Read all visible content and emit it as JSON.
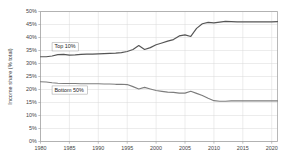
{
  "chart_data": {
    "type": "line",
    "title": "",
    "xlabel": "",
    "ylabel": "Income share (% total)",
    "xlim": [
      1980,
      2021
    ],
    "ylim": [
      0,
      50
    ],
    "grid": true,
    "legend_position": "inline-labels",
    "x_ticks": [
      "1980",
      "1985",
      "1990",
      "1995",
      "2000",
      "2005",
      "2010",
      "2015",
      "2020"
    ],
    "x_tick_values": [
      1980,
      1985,
      1990,
      1995,
      2000,
      2005,
      2010,
      2015,
      2020
    ],
    "y_ticks": [
      "0%",
      "5%",
      "10%",
      "15%",
      "20%",
      "25%",
      "30%",
      "35%",
      "40%",
      "45%",
      "50%"
    ],
    "y_tick_values": [
      0,
      5,
      10,
      15,
      20,
      25,
      30,
      35,
      40,
      45,
      50
    ],
    "x": [
      1980,
      1981,
      1982,
      1983,
      1984,
      1985,
      1986,
      1987,
      1988,
      1989,
      1990,
      1991,
      1992,
      1993,
      1994,
      1995,
      1996,
      1997,
      1998,
      1999,
      2000,
      2001,
      2002,
      2003,
      2004,
      2005,
      2006,
      2007,
      2008,
      2009,
      2010,
      2011,
      2012,
      2013,
      2014,
      2015,
      2016,
      2017,
      2018,
      2019,
      2020,
      2021
    ],
    "series": [
      {
        "name": "Top 10%",
        "color": "#555555",
        "label_x": 1982.0,
        "label_y": 36.4,
        "values": [
          32.6,
          32.6,
          32.9,
          33.4,
          33.5,
          33.2,
          33.3,
          33.5,
          33.6,
          33.6,
          33.7,
          33.8,
          33.9,
          34.0,
          34.2,
          34.6,
          35.4,
          36.9,
          35.4,
          36.1,
          37.2,
          37.9,
          38.6,
          39.2,
          40.6,
          41.0,
          40.4,
          43.5,
          45.3,
          45.8,
          45.6,
          45.9,
          46.2,
          46.1,
          46.0,
          46.0,
          46.0,
          46.0,
          46.0,
          46.0,
          46.0,
          46.1
        ]
      },
      {
        "name": "Bottom 50%",
        "color": "#7d7d7d",
        "label_x": 1982.0,
        "label_y": 19.8,
        "values": [
          23.0,
          22.9,
          22.6,
          22.4,
          22.3,
          22.3,
          22.3,
          22.2,
          22.2,
          22.2,
          22.2,
          22.1,
          22.1,
          22.0,
          22.0,
          21.9,
          21.1,
          20.2,
          20.8,
          20.2,
          19.6,
          19.3,
          19.0,
          18.9,
          18.6,
          18.6,
          19.3,
          18.5,
          17.7,
          16.6,
          15.7,
          15.5,
          15.5,
          15.6,
          15.6,
          15.6,
          15.6,
          15.6,
          15.6,
          15.6,
          15.6,
          15.6
        ]
      }
    ]
  },
  "series_labels": [
    {
      "text": "Top 10%"
    },
    {
      "text": "Bottom 50%"
    }
  ]
}
